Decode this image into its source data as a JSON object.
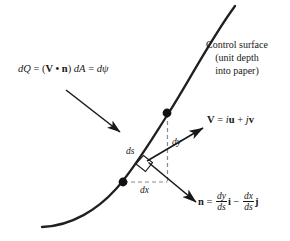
{
  "figure": {
    "background_color": "#ffffff",
    "ink_color": "#181818"
  },
  "labels": {
    "flux_equation": {
      "d1": "d",
      "Q": "Q",
      "eq1": " = (",
      "V": "V",
      "dot": " • ",
      "n": "n",
      "close": ") ",
      "d2": "d",
      "A": "A",
      "eq2": " = ",
      "d3": "d",
      "psi": "ψ",
      "plain": "dQ = (V • n) dA = dψ"
    },
    "control_surface": {
      "line1": "Control surface",
      "line2": "(unit depth",
      "line3": "into paper)",
      "plain": "Control surface (unit depth into paper)"
    },
    "velocity": {
      "V": "V",
      "eq": " = ",
      "i": "i",
      "u": "u",
      "plus": " + ",
      "j": "j",
      "v": "v",
      "plain": "V = iu + jv"
    },
    "normal": {
      "n": "n",
      "eq": " = ",
      "num1": "dy",
      "den1": "ds",
      "i": "i",
      "minus": " − ",
      "num2": "dx",
      "den2": "ds",
      "j": "j",
      "plain": "n = (dy/ds) i − (dx/ds) j"
    },
    "ds": "ds",
    "dy": "dy",
    "dx": "dx"
  },
  "geometry": {
    "curve_description": "S-shaped control surface curve",
    "points": {
      "lower_dot": {
        "x": 123,
        "y": 182
      },
      "upper_dot": {
        "x": 167,
        "y": 113
      },
      "vector_origin": {
        "x": 147,
        "y": 161
      }
    },
    "vectors": {
      "velocity_tip": {
        "x": 204,
        "y": 127
      },
      "normal_tip": {
        "x": 197,
        "y": 203
      },
      "callout_start": {
        "x": 66,
        "y": 90
      },
      "callout_tip": {
        "x": 121,
        "y": 133
      }
    }
  }
}
